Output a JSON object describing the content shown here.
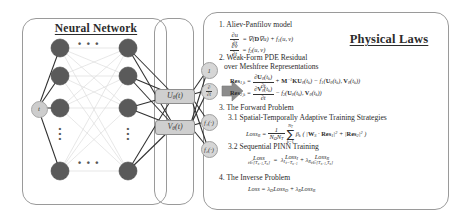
{
  "figure": {
    "kind": "schematic-diagram",
    "caption_none": ""
  },
  "left_panel": {
    "title": "Neural Network",
    "input_node_label": "t",
    "hidden_layer_ellipsis_h": "• • •",
    "hidden_layer_ellipsis_v": "⋮",
    "bottom_ellipsis": "• • •",
    "node_count_visible": 8
  },
  "io_panel": {
    "outputs": [
      {
        "name": "output-u",
        "label": "Uθ(t)"
      },
      {
        "name": "output-v",
        "label": "Vθ(t)"
      }
    ]
  },
  "derived_nodes": [
    {
      "name": "node-one",
      "label": "1",
      "type": "plain"
    },
    {
      "name": "node-du-dt",
      "type": "fraction",
      "num": "∂",
      "den": "∂t"
    },
    {
      "name": "node-f1",
      "label": "f₁(·)",
      "type": "plain"
    },
    {
      "name": "node-f2",
      "label": "f₂(·)",
      "type": "plain"
    }
  ],
  "arrow": {
    "name": "flow-arrow",
    "direction": "right"
  },
  "right_panel": {
    "title": "Physical Laws",
    "sections": [
      {
        "number": "1.",
        "heading": "Aliev-Panfilov model",
        "equations": [
          "∂u/∂t = ∇(D∇u) + f₁(u, v)",
          "∂v/∂t = f₂(u, v)"
        ]
      },
      {
        "number": "2.",
        "heading": "Weak-Form PDE Residual",
        "heading2": "over Meshfree Representations",
        "equations": [
          "Res₁,ₖ = ∂Uθ(tₖ)/∂t + M⁻¹KUθ(tₖ) − f₁(Uθ(tₖ), Vθ(tₖ))",
          "Res₂,ₖ = ∂Vθ(tₖ)/∂t − f₂(Uθ(tₖ), Vθ(tₖ))"
        ]
      },
      {
        "number": "3.",
        "heading": "The Forward Problem",
        "sub": [
          {
            "number": "3.1",
            "heading": "Spatial-Temporally Adaptive Training Strategies",
            "equation": "Loss_R = (1/(N_Ω N_T)) Σ_{k=1}^{N_T} βₖ ( |W_S · Res₁|² + |Res₂|² )"
          },
          {
            "number": "3.2",
            "heading": "Sequential PINN Training",
            "equation": "Loss_{t∈[Tₙ₋₁,Tₙ]} = λ_I Loss_{I, t=Tₙ₋₁} + λ_R Loss_{R, t∈[Tₙ₋₁,Tₙ]}"
          }
        ]
      },
      {
        "number": "4.",
        "heading": "The Inverse Problem",
        "equations": [
          "Loss = λ_D Loss_D + λ_R Loss_R"
        ]
      }
    ]
  },
  "colors": {
    "node_fill": "#5a5a5a",
    "chip_fill": "#cfcfcf",
    "panel_stroke": "#9a9a9a",
    "edge_dark": "#2f2f2f",
    "edge_light": "#d9d9d9",
    "arrow_fill": "#8c8c8c",
    "text": "#2b2b2b"
  }
}
